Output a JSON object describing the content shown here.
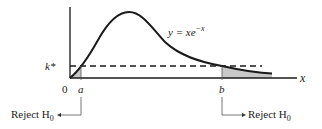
{
  "diagram": {
    "curve_label_prefix": "y = xe",
    "curve_label_exp": "−x",
    "x_axis_label": "x",
    "origin_label": "0",
    "threshold_label": "k*",
    "point_a_label": "a",
    "point_b_label": "b",
    "left_reject_label": "Reject H",
    "left_reject_sub": "0",
    "right_reject_label": "Reject H",
    "right_reject_sub": "0",
    "colors": {
      "line": "#1a1a1a",
      "shade": "#c8c8c8",
      "leader": "#555555"
    }
  }
}
